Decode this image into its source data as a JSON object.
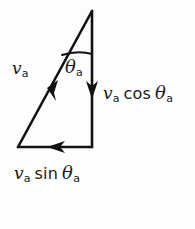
{
  "figure": {
    "type": "vector-decomposition-diagram",
    "background_color": "#fdfdfd",
    "stroke_color": "#121212"
  },
  "labels": {
    "hypotenuse": {
      "variable": "v",
      "subscript": "a",
      "full_text": "v_a"
    },
    "vertical_component": {
      "variable": "v",
      "subscript": "a",
      "function": "cos",
      "angle": "θ",
      "angle_subscript": "a",
      "full_text": "v_a cos θ_a"
    },
    "horizontal_component": {
      "variable": "v",
      "subscript": "a",
      "function": "sin",
      "angle": "θ",
      "angle_subscript": "a",
      "full_text": "v_a sin θ_a"
    },
    "angle": {
      "symbol": "θ",
      "subscript": "a",
      "full_text": "θ_a"
    }
  },
  "geometry": {
    "apex": {
      "x": 92,
      "y": 11
    },
    "bottom_left": {
      "x": 18,
      "y": 147
    },
    "bottom_right": {
      "x": 92,
      "y": 147
    },
    "arrow_directions": {
      "hypotenuse": "down-left",
      "vertical": "down",
      "horizontal": "left"
    },
    "angle_arc_y": 55
  }
}
